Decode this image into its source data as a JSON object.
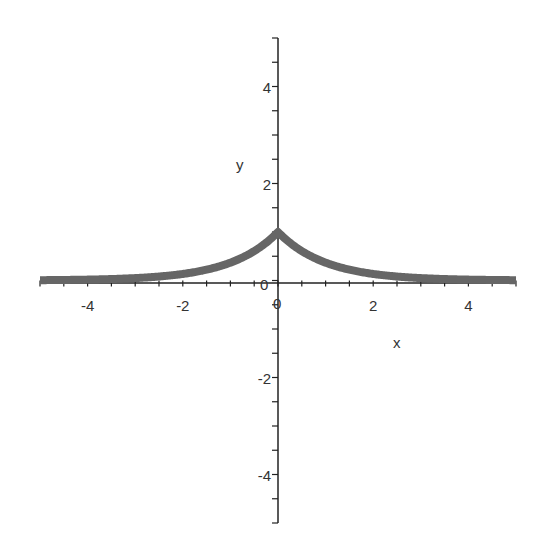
{
  "chart_data": {
    "type": "line",
    "title": "",
    "function": "y = exp(-|x|)",
    "xlabel": "x",
    "ylabel": "y",
    "xlim": [
      -5,
      5
    ],
    "ylim": [
      -5,
      5
    ],
    "x_ticks": [
      -4,
      -2,
      0,
      2,
      4
    ],
    "y_ticks": [
      -4,
      -2,
      0,
      2,
      4
    ],
    "x_tick_labels": [
      "-4",
      "-2",
      "0",
      "2",
      "4"
    ],
    "y_tick_labels": [
      "-4",
      "-2",
      "0",
      "2",
      "4"
    ],
    "grid": false,
    "legend": null,
    "series": [
      {
        "name": "exp(-|x|)",
        "color": "#666666",
        "x": [
          -5,
          -4,
          -3,
          -2,
          -1.5,
          -1,
          -0.5,
          0,
          0.5,
          1,
          1.5,
          2,
          3,
          4,
          5
        ],
        "y": [
          0.007,
          0.018,
          0.05,
          0.135,
          0.223,
          0.368,
          0.607,
          1.0,
          0.607,
          0.368,
          0.223,
          0.135,
          0.05,
          0.018,
          0.007
        ]
      }
    ]
  },
  "axes": {
    "x_label": "x",
    "y_label": "y",
    "origin_label": "0"
  }
}
